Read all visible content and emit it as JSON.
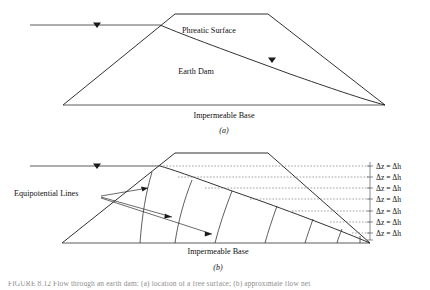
{
  "figure": {
    "width": 430,
    "height": 290,
    "background": "#ffffff",
    "line_color": "#1a1a1a",
    "dashed_color": "#7a7a7a",
    "text_color": "#111111"
  },
  "panel_a": {
    "key": "(a)",
    "labels": {
      "phreatic_surface": "Phreatic Surface",
      "earth_dam": "Earth Dam",
      "impermeable_base": "Impermeable Base"
    },
    "geometry": {
      "left_toe": [
        63,
        105
      ],
      "crest_left": [
        175,
        14
      ],
      "crest_right": [
        268,
        14
      ],
      "right_toe": [
        385,
        105
      ],
      "base_y": 105,
      "water_level_y": 25,
      "water_level_x_start": [
        30,
        25
      ],
      "water_level_x_end": [
        160,
        25
      ],
      "water_marker_x": 97,
      "phreatic_marker_x": 272,
      "phreatic_marker_y": 62
    }
  },
  "panel_b": {
    "key": "(b)",
    "labels": {
      "equipotential_lines": "Equipotential Lines",
      "impermeable_base": "Impermeable Base"
    },
    "geometry": {
      "left_toe": [
        62,
        243
      ],
      "crest_left": [
        175,
        153
      ],
      "crest_right": [
        268,
        153
      ],
      "right_toe": [
        370,
        243
      ],
      "base_y": 243,
      "water_level_y": 166,
      "water_level_x_start": [
        30,
        166
      ],
      "water_level_x_end": [
        160,
        166
      ],
      "water_marker_x": 97
    },
    "equipotential_count": 7,
    "head_drop_labels": [
      {
        "text": "Δz = Δh",
        "y": 166
      },
      {
        "text": "Δz = Δh",
        "y": 177
      },
      {
        "text": "Δz = Δh",
        "y": 188
      },
      {
        "text": "Δz = Δh",
        "y": 199
      },
      {
        "text": "Δz = Δh",
        "y": 211
      },
      {
        "text": "Δz = Δh",
        "y": 222
      },
      {
        "text": "Δz = Δh",
        "y": 233
      }
    ],
    "head_drop_symbol": {
      "delta_z": "Δz",
      "equals": "=",
      "delta_h": "Δh"
    }
  },
  "caption": {
    "clipped_text": "FIGURE 8.12  Flow through an earth dam: (a) location of a free surface; (b) approximate flow net"
  }
}
